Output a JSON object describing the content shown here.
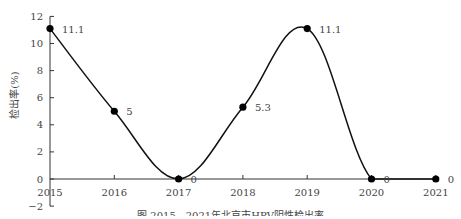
{
  "chart_data": {
    "type": "line",
    "title": "",
    "caption": "图  2015—2021年北京市HPV阴性检出率",
    "xlabel": "",
    "ylabel": "检出率(%)",
    "categories": [
      "2015",
      "2016",
      "2017",
      "2018",
      "2019",
      "2020",
      "2021"
    ],
    "series": [
      {
        "name": "检出率",
        "values": [
          11.1,
          5,
          0,
          5.3,
          11.1,
          0,
          0
        ]
      }
    ],
    "data_labels": [
      "11.1",
      "5",
      "0",
      "5.3",
      "11.1",
      "0",
      "0"
    ],
    "ylim": [
      -2,
      12
    ],
    "yticks": [
      -2,
      0,
      2,
      4,
      6,
      8,
      10,
      12
    ],
    "grid": false,
    "legend": "none",
    "line_color": "#111111",
    "smooth": true
  }
}
